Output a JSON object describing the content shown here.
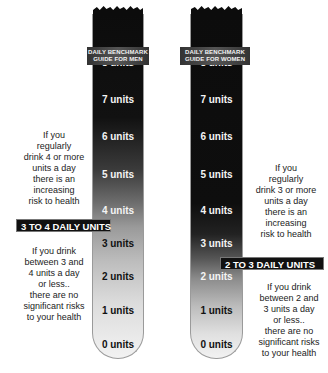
{
  "men": {
    "guide_line1": "DAILY BENCHMARK",
    "guide_line2": "GUIDE FOR MEN",
    "units": [
      "8 units",
      "7 units",
      "6 units",
      "5 units",
      "4 units",
      "3 units",
      "2 units",
      "1 units",
      "0 units"
    ],
    "band_label": "3 TO 4 DAILY UNITS",
    "warning_lines": [
      "If you",
      "regularly",
      "drink 4 or more",
      "units a day",
      "there is an",
      "increasing",
      "risk to health"
    ],
    "safe_lines": [
      "If you drink",
      "between 3 and",
      "4 units a day",
      "or less..",
      "there are no",
      "significant risks",
      "to your health"
    ]
  },
  "women": {
    "guide_line1": "DAILY BENCHMARK",
    "guide_line2": "GUIDE FOR WOMEN",
    "units": [
      "8 units",
      "7 units",
      "6 units",
      "5 units",
      "4 units",
      "3 units",
      "2 units",
      "1 units",
      "0 units"
    ],
    "band_label": "2 TO 3 DAILY UNITS",
    "warning_lines": [
      "If you",
      "regularly",
      "drink 3 or more",
      "units a day",
      "there is an",
      "increasing",
      "risk to health"
    ],
    "safe_lines": [
      "If you drink",
      "between 2 and",
      "3 units a day",
      "or less..",
      "there are no",
      "significant risks",
      "to your health"
    ]
  },
  "colors": {
    "tube_top": "#0c0c0c",
    "tube_bottom": "#f2f2f2",
    "band_bg": "#111111",
    "band_text": "#ffffff"
  }
}
